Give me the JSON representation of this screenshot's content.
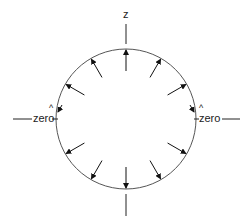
{
  "labels": {
    "top": "z",
    "left": "zero",
    "right": "zero"
  },
  "diagram": {
    "center": [
      126,
      119
    ],
    "radius": 70,
    "inward_arrows": 12,
    "stroke_color": "#333333"
  }
}
